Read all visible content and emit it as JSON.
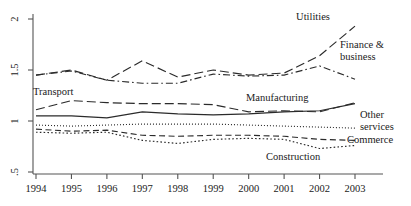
{
  "chart_data": {
    "type": "line",
    "title": "",
    "xlabel": "",
    "ylabel": "",
    "grid": false,
    "legend_position": "inline-annotations",
    "x": [
      1994,
      1995,
      1996,
      1997,
      1998,
      1999,
      2000,
      2001,
      2002,
      2003
    ],
    "xtick_labels": [
      "1994",
      "1995",
      "1996",
      "1997",
      "1998",
      "1999",
      "2000",
      "2001",
      "2002",
      "2003"
    ],
    "ytick_labels": [
      ".5",
      "1",
      "1.5",
      "2"
    ],
    "ytick_values": [
      0.5,
      1.0,
      1.5,
      2.0
    ],
    "ylim": [
      0.45,
      2.05
    ],
    "xlim": [
      1993.7,
      2003.4
    ],
    "series": [
      {
        "name": "Utilities",
        "label": "Utilities",
        "dash": "long-dash",
        "values": [
          1.45,
          1.5,
          1.4,
          1.59,
          1.43,
          1.5,
          1.45,
          1.47,
          1.64,
          1.93
        ]
      },
      {
        "name": "Finance & business",
        "label": "Finance & business",
        "dash": "dash-dot",
        "values": [
          1.45,
          1.49,
          1.4,
          1.37,
          1.37,
          1.46,
          1.44,
          1.45,
          1.54,
          1.41
        ]
      },
      {
        "name": "Transport",
        "label": "Transport",
        "dash": "long-dash",
        "values": [
          1.11,
          1.2,
          1.18,
          1.17,
          1.17,
          1.16,
          1.09,
          1.1,
          1.09,
          1.18
        ]
      },
      {
        "name": "Manufacturing",
        "label": "Manufacturing",
        "dash": "solid",
        "values": [
          1.05,
          1.05,
          1.03,
          1.09,
          1.07,
          1.06,
          1.07,
          1.09,
          1.1,
          1.17
        ]
      },
      {
        "name": "Other services",
        "label": "Other services",
        "dash": "dotted-fine",
        "values": [
          0.96,
          0.95,
          0.96,
          0.97,
          0.97,
          0.97,
          0.96,
          0.95,
          0.94,
          0.93
        ]
      },
      {
        "name": "Commerce",
        "label": "Commerce",
        "dash": "medium-dash",
        "values": [
          0.92,
          0.9,
          0.91,
          0.86,
          0.85,
          0.86,
          0.86,
          0.85,
          0.82,
          0.81
        ]
      },
      {
        "name": "Construction",
        "label": "Construction",
        "dash": "dotted",
        "values": [
          0.89,
          0.88,
          0.89,
          0.81,
          0.78,
          0.82,
          0.83,
          0.82,
          0.73,
          0.76
        ]
      }
    ],
    "annotations": [
      {
        "name": "utilities",
        "text": "Utilities",
        "x": 313,
        "y": 20,
        "anchor": "middle"
      },
      {
        "name": "finance-business-line1",
        "text": "Finance &",
        "x": 340,
        "y": 48,
        "anchor": "start"
      },
      {
        "name": "finance-business-line2",
        "text": "business",
        "x": 340,
        "y": 60,
        "anchor": "start"
      },
      {
        "name": "transport",
        "text": "Transport",
        "x": 33,
        "y": 95,
        "anchor": "start"
      },
      {
        "name": "manufacturing",
        "text": "Manufacturing",
        "x": 246,
        "y": 101,
        "anchor": "start"
      },
      {
        "name": "other-services-line1",
        "text": "Other",
        "x": 360,
        "y": 118,
        "anchor": "start"
      },
      {
        "name": "other-services-line2",
        "text": "services",
        "x": 360,
        "y": 130,
        "anchor": "start"
      },
      {
        "name": "commerce",
        "text": "Commerce",
        "x": 347,
        "y": 143,
        "anchor": "start"
      },
      {
        "name": "construction",
        "text": "Construction",
        "x": 266,
        "y": 160,
        "anchor": "start"
      }
    ]
  }
}
